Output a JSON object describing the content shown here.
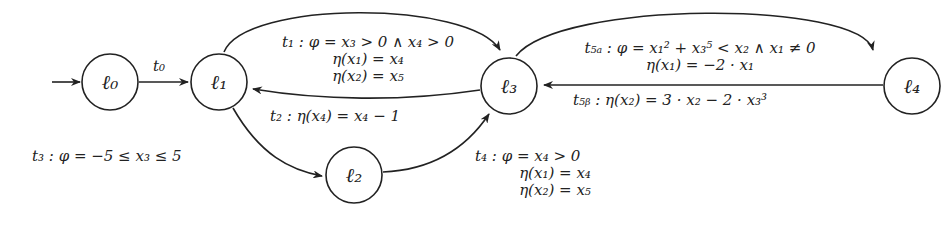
{
  "diagram": {
    "type": "automaton",
    "nodes": [
      {
        "id": "l0",
        "label": "ℓ₀",
        "initial": true
      },
      {
        "id": "l1",
        "label": "ℓ₁"
      },
      {
        "id": "l2",
        "label": "ℓ₂"
      },
      {
        "id": "l3",
        "label": "ℓ₃"
      },
      {
        "id": "l4",
        "label": "ℓ₄"
      }
    ],
    "edges": [
      {
        "id": "t0",
        "from": "l0",
        "to": "l1",
        "label": "t₀"
      },
      {
        "id": "t1",
        "from": "l1",
        "to": "l3",
        "lines": [
          "t₁ : φ = x₃ > 0 ∧ x₄ > 0",
          "η(x₁) = x₄",
          "η(x₂) = x₅"
        ]
      },
      {
        "id": "t2",
        "from": "l3",
        "to": "l1",
        "lines": [
          "t₂ : η(x₄) = x₄ − 1"
        ]
      },
      {
        "id": "t3",
        "from": "l1",
        "to": "l2",
        "lines": [
          "t₃ : φ = −5 ≤ x₃ ≤ 5"
        ]
      },
      {
        "id": "t4",
        "from": "l2",
        "to": "l3",
        "lines": [
          "t₄ : φ = x₄ > 0",
          "η(x₁) = x₄",
          "η(x₂) = x₅"
        ]
      },
      {
        "id": "t5a",
        "from": "l3",
        "to": "l4",
        "lines": [
          "t₅ₐ : φ = x₁² + x₃⁵ < x₂ ∧ x₁ ≠ 0",
          "η(x₁) = −2 · x₁"
        ]
      },
      {
        "id": "t5b",
        "from": "l4",
        "to": "l3",
        "lines": [
          "t₅ᵦ : η(x₂) = 3 · x₂ − 2 · x₃³"
        ]
      }
    ]
  }
}
